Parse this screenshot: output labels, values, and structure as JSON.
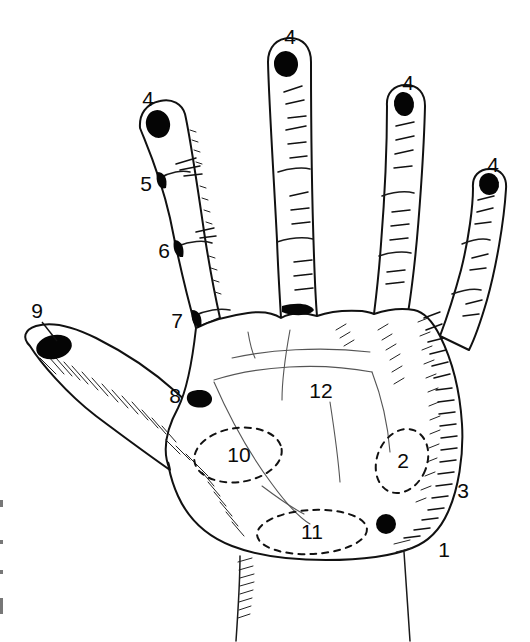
{
  "figure": {
    "background_color": "#ffffff",
    "ink_color": "#111111",
    "marker_color": "#050505"
  },
  "labels": [
    {
      "id": "index-tip",
      "text": "4",
      "x": 148,
      "y": 100
    },
    {
      "id": "middle-tip",
      "text": "4",
      "x": 290,
      "y": 38
    },
    {
      "id": "ring-tip",
      "text": "4",
      "x": 408,
      "y": 84
    },
    {
      "id": "little-tip",
      "text": "4",
      "x": 493,
      "y": 166
    },
    {
      "id": "index-dip",
      "text": "5",
      "x": 146,
      "y": 185
    },
    {
      "id": "index-pip",
      "text": "6",
      "x": 164,
      "y": 252
    },
    {
      "id": "index-mcp",
      "text": "7",
      "x": 177,
      "y": 322
    },
    {
      "id": "index-web",
      "text": "8",
      "x": 175,
      "y": 397
    },
    {
      "id": "thumb-tip",
      "text": "9",
      "x": 37,
      "y": 312
    },
    {
      "id": "thenar-region",
      "text": "10",
      "x": 239,
      "y": 456
    },
    {
      "id": "distal-wrist",
      "text": "11",
      "x": 312,
      "y": 533
    },
    {
      "id": "hypothenar-region",
      "text": "2",
      "x": 403,
      "y": 462
    },
    {
      "id": "palm-center",
      "text": "12",
      "x": 321,
      "y": 392
    },
    {
      "id": "ulnar-border",
      "text": "3",
      "x": 463,
      "y": 492
    },
    {
      "id": "wrist-ulnar",
      "text": "1",
      "x": 444,
      "y": 551
    }
  ],
  "marker_dots": [
    {
      "id": "index-tip-dot",
      "cx": 158,
      "cy": 124,
      "rx": 12,
      "ry": 14,
      "rotate": -14
    },
    {
      "id": "middle-tip-dot",
      "cx": 286,
      "cy": 64,
      "rx": 12,
      "ry": 13,
      "rotate": -8
    },
    {
      "id": "ring-tip-dot",
      "cx": 404,
      "cy": 104,
      "rx": 10,
      "ry": 12,
      "rotate": -8
    },
    {
      "id": "little-tip-dot",
      "cx": 489,
      "cy": 184,
      "rx": 10,
      "ry": 11,
      "rotate": -10
    },
    {
      "id": "thumb-tip-dot",
      "cx": 54,
      "cy": 347,
      "rx": 18,
      "ry": 12,
      "rotate": -12
    },
    {
      "id": "hypothenar-dot",
      "cx": 386,
      "cy": 524,
      "rx": 10,
      "ry": 10,
      "rotate": 0
    }
  ],
  "regions": [
    {
      "id": "thenar-ellipse",
      "cx": 238,
      "cy": 455,
      "rx": 44,
      "ry": 27,
      "rotate": -8
    },
    {
      "id": "hypothenar-ellipse",
      "cx": 402,
      "cy": 461,
      "rx": 25,
      "ry": 33,
      "rotate": 22
    },
    {
      "id": "wrist-ellipse",
      "cx": 312,
      "cy": 532,
      "rx": 55,
      "ry": 22,
      "rotate": -3
    }
  ]
}
